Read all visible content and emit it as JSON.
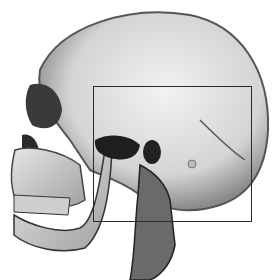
{
  "image": {
    "subject": "skull-lateral-view-3d-rendering",
    "background_color": "#ffffff",
    "bone_color": "#d8d8d8",
    "shadow_color": "#1e1e1e"
  },
  "region_of_interest": {
    "x": 93,
    "y": 86,
    "width": 159,
    "height": 136,
    "stroke_color": "#2a2a2a"
  }
}
